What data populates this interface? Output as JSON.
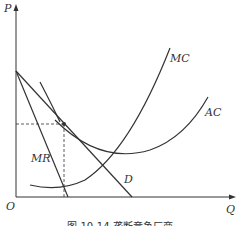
{
  "figure": {
    "caption": "图 10-14  垄断竞争厂商",
    "axes": {
      "y_label": "P",
      "x_label": "Q",
      "origin_label": "O"
    },
    "curves": [
      {
        "name": "MC",
        "label": "MC"
      },
      {
        "name": "AC",
        "label": "AC"
      },
      {
        "name": "MR",
        "label": "MR"
      },
      {
        "name": "D",
        "label": "D"
      }
    ],
    "colors": {
      "line": "#333333",
      "background": "#ffffff"
    }
  }
}
